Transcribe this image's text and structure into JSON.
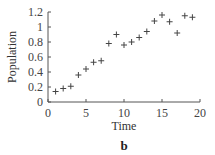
{
  "chart_data": {
    "type": "scatter",
    "title": "",
    "panel_label": "b",
    "xlabel": "Time",
    "ylabel": "Population",
    "xlim": [
      0,
      20
    ],
    "ylim": [
      0,
      1.2
    ],
    "xticks": [
      0,
      5,
      10,
      15,
      20
    ],
    "xtick_labels": [
      "0",
      "5",
      "10",
      "15",
      "20"
    ],
    "yticks": [
      0,
      0.2,
      0.4,
      0.6,
      0.8,
      1,
      1.2
    ],
    "ytick_labels": [
      "0",
      "0.2",
      "0.4",
      "0.6",
      "0.8",
      "1",
      "1.2"
    ],
    "grid": false,
    "legend": null,
    "marker": "+",
    "series": [
      {
        "name": "Population",
        "x": [
          1,
          2,
          3,
          4,
          5,
          6,
          7,
          8,
          9,
          10,
          11,
          12,
          13,
          14,
          15,
          16,
          17,
          18,
          19
        ],
        "y": [
          0.14,
          0.18,
          0.21,
          0.36,
          0.44,
          0.53,
          0.55,
          0.78,
          0.9,
          0.76,
          0.8,
          0.86,
          0.94,
          1.08,
          1.16,
          1.07,
          0.92,
          1.15,
          1.13
        ]
      }
    ],
    "colors": {
      "axis": "#555555",
      "marker": "#444444",
      "text": "#333333"
    }
  }
}
